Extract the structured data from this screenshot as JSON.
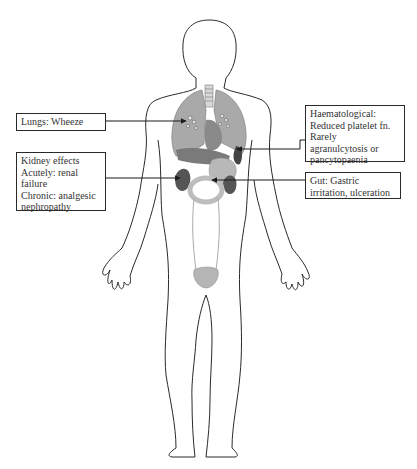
{
  "diagram": {
    "labels": {
      "lungs": {
        "lines": [
          "Lungs: Wheeze"
        ]
      },
      "kidney": {
        "lines": [
          "Kidney effects",
          "Acutely: renal",
          "failure",
          "Chronic: analgesic",
          "nephropathy"
        ]
      },
      "haematological": {
        "lines": [
          "Haematological:",
          "Reduced platelet fn.",
          "Rarely",
          "agranulcytosis or",
          "pancytopaenia"
        ]
      },
      "gut": {
        "lines": [
          "Gut: Gastric",
          "irritation, ulceration"
        ]
      }
    },
    "organs": [
      "trachea",
      "lungs",
      "heart",
      "liver",
      "spleen",
      "stomach",
      "kidneys",
      "intestine",
      "ureters",
      "bladder"
    ],
    "colors": {
      "outline": "#2a2a2a",
      "lung": "#a9a9a9",
      "lung_dark": "#8a8a8a",
      "organ_dark": "#555555",
      "organ_mid": "#9a9a9a",
      "organ_light": "#c8c8c8",
      "leader": "#1a1a1a"
    }
  }
}
